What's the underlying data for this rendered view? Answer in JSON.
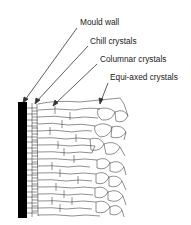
{
  "diagram": {
    "type": "casting solidification structure",
    "labels": [
      {
        "id": "mould-wall",
        "text": "Mould wall",
        "x": 80,
        "y": 17
      },
      {
        "id": "chill-crystals",
        "text": "Chill crystals",
        "x": 90,
        "y": 36
      },
      {
        "id": "columnar-crystals",
        "text": "Columnar crystals",
        "x": 100,
        "y": 54
      },
      {
        "id": "equi-axed-crystals",
        "text": "Equi-axed crystals",
        "x": 110,
        "y": 72
      }
    ],
    "colors": {
      "wall": "#000000",
      "lines": "#333333",
      "text": "#222222"
    }
  }
}
